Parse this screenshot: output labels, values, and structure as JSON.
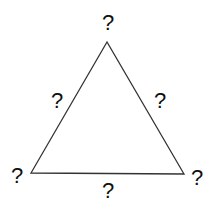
{
  "diagram": {
    "shape": "triangle",
    "stroke_color": "#333333",
    "vertices": {
      "top": {
        "label": "?"
      },
      "bottom_left": {
        "label": "?"
      },
      "bottom_right": {
        "label": "?"
      }
    },
    "sides": {
      "left": {
        "label": "?"
      },
      "right": {
        "label": "?"
      },
      "bottom": {
        "label": "?"
      }
    }
  }
}
